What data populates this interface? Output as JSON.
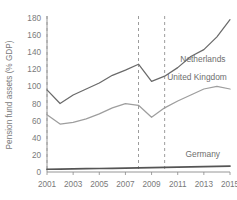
{
  "chart_data": {
    "type": "line",
    "title": "",
    "xlabel": "",
    "ylabel": "Pension fund assets (% GDP)",
    "xlim": [
      2001,
      2015
    ],
    "ylim": [
      0,
      180
    ],
    "grid": false,
    "legend_position": "inline-right",
    "x": [
      2001,
      2002,
      2003,
      2004,
      2005,
      2006,
      2007,
      2008,
      2009,
      2010,
      2011,
      2012,
      2013,
      2014,
      2015
    ],
    "xticks": [
      "2001",
      "2003",
      "2005",
      "2007",
      "2009",
      "2011",
      "2013",
      "2015"
    ],
    "xtick_values": [
      2001,
      2003,
      2005,
      2007,
      2009,
      2011,
      2013,
      2015
    ],
    "yticks": [
      "0",
      "20",
      "40",
      "60",
      "80",
      "100",
      "120",
      "140",
      "160",
      "180"
    ],
    "ytick_values": [
      0,
      20,
      40,
      60,
      80,
      100,
      120,
      140,
      160,
      180
    ],
    "vertical_reference_lines": [
      2001,
      2008,
      2010
    ],
    "series": [
      {
        "name": "Netherlands",
        "color": "#6a6a6a",
        "label_x": 2011.2,
        "label_y": 129,
        "values": [
          96,
          80,
          90,
          97,
          104,
          113,
          119,
          126,
          106,
          112,
          122,
          135,
          143,
          158,
          178
        ]
      },
      {
        "name": "United Kingdom",
        "color": "#9e9e9e",
        "label_x": 2010.2,
        "label_y": 107,
        "values": [
          67,
          56,
          58,
          62,
          68,
          75,
          80,
          78,
          64,
          75,
          83,
          90,
          97,
          100,
          97
        ]
      },
      {
        "name": "Germany",
        "color": "#555555",
        "label_x": 2011.6,
        "label_y": 18,
        "values": [
          3.2,
          3.4,
          3.6,
          3.9,
          4.1,
          4.3,
          4.6,
          4.8,
          5.1,
          5.4,
          5.7,
          6.0,
          6.3,
          6.6,
          6.9
        ]
      }
    ]
  },
  "axis": {
    "line_color": "#8a8a8a",
    "reference_line_color": "#9c9c9c"
  }
}
